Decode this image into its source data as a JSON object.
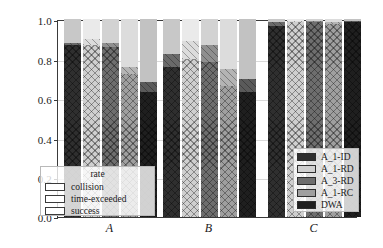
{
  "chart_data": {
    "type": "bar",
    "subtype": "stacked-grouped-bar",
    "title": "",
    "xlabel": "",
    "ylabel": "",
    "categories": [
      "A",
      "B",
      "C"
    ],
    "ylim": [
      0.0,
      1.0
    ],
    "ytick_labels": [
      "0.0",
      "0.2",
      "0.4",
      "0.6",
      "0.8",
      "1.0"
    ],
    "ytick_values": [
      0.0,
      0.2,
      0.4,
      0.6,
      0.8,
      1.0
    ],
    "grid": true,
    "methods": [
      "A_1-ID",
      "A_1-RD",
      "A_3-RD",
      "A_1-RC",
      "DWA"
    ],
    "stack_order": [
      "success",
      "time-exceeded",
      "collision"
    ],
    "stack_labels": {
      "success": "success",
      "time_exceeded": "time-exceeded",
      "collision": "collision"
    },
    "series": [
      {
        "name": "success",
        "hatch": "xx",
        "groups": {
          "A": [
            0.87,
            0.87,
            0.86,
            0.72,
            0.63
          ],
          "B": [
            0.76,
            0.8,
            0.785,
            0.66,
            0.63
          ],
          "C": [
            0.965,
            0.985,
            0.985,
            0.975,
            0.985
          ]
        }
      },
      {
        "name": "time-exceeded",
        "hatch": "\\\\",
        "groups": {
          "A": [
            0.01,
            0.03,
            0.02,
            0.04,
            0.05
          ],
          "B": [
            0.065,
            0.09,
            0.085,
            0.09,
            0.065
          ],
          "C": [
            0.02,
            0.005,
            0.005,
            0.01,
            0.005
          ]
        }
      },
      {
        "name": "collision",
        "hatch": "",
        "groups": {
          "A": [
            0.12,
            0.1,
            0.12,
            0.24,
            0.32
          ],
          "B": [
            0.175,
            0.11,
            0.13,
            0.25,
            0.305
          ],
          "C": [
            0.015,
            0.01,
            0.01,
            0.015,
            0.01
          ]
        }
      }
    ],
    "cumulative_tops": {
      "A": {
        "success": [
          0.87,
          0.87,
          0.86,
          0.72,
          0.63
        ],
        "time_exceeded": [
          0.88,
          0.9,
          0.88,
          0.76,
          0.68
        ]
      },
      "B": {
        "success": [
          0.76,
          0.8,
          0.785,
          0.66,
          0.63
        ],
        "time_exceeded": [
          0.825,
          0.89,
          0.87,
          0.75,
          0.695
        ]
      },
      "C": {
        "success": [
          0.965,
          0.985,
          0.985,
          0.975,
          0.985
        ],
        "time_exceeded": [
          0.985,
          0.99,
          0.99,
          0.985,
          0.99
        ]
      }
    },
    "method_colors": [
      "#2f2f2f",
      "#cfcfcf",
      "#6e6e6e",
      "#9f9f9f",
      "#1f1f1f"
    ],
    "method_colors_light": [
      "#c8c8c8",
      "#eaeaea",
      "#d2d2d2",
      "#dcdcdc",
      "#c2c2c2"
    ],
    "method_colors_mid": [
      "#6a6a6a",
      "#dcdcdc",
      "#8f8f8f",
      "#b4b4b4",
      "#5a5a5a"
    ],
    "legend_rate": {
      "title": "rate",
      "entries": [
        "collision",
        "time-exceeded",
        "success"
      ]
    },
    "legend_methods": {
      "entries": [
        "A_1-ID",
        "A_1-RD",
        "A_3-RD",
        "A_1-RC",
        "DWA"
      ]
    },
    "axis_color": "#3a3a3a",
    "grid_color": "#d9d9d9",
    "background": "#ffffff"
  }
}
